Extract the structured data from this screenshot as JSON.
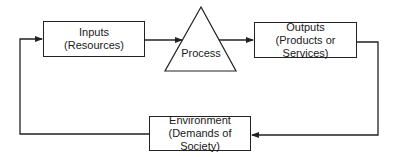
{
  "diagram": {
    "type": "flow-loop",
    "nodes": {
      "inputs": {
        "title": "Inputs",
        "subtitle": "(Resources)"
      },
      "process": {
        "title": "Process"
      },
      "outputs": {
        "title": "Outputs",
        "subtitle": "(Products or Services)"
      },
      "environment": {
        "title": "Environment",
        "subtitle": "(Demands of Society)"
      }
    },
    "edges": [
      {
        "from": "inputs",
        "to": "process"
      },
      {
        "from": "process",
        "to": "outputs"
      },
      {
        "from": "outputs",
        "to": "environment"
      },
      {
        "from": "environment",
        "to": "inputs"
      }
    ]
  }
}
